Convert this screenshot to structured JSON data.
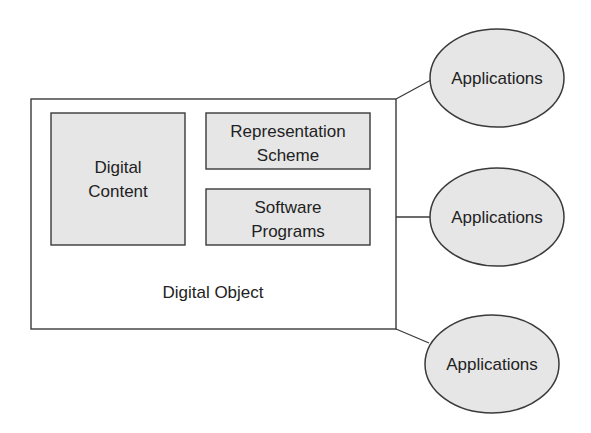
{
  "diagram": {
    "container": {
      "label": "Digital Object"
    },
    "components": [
      {
        "id": "digital-content",
        "lines": [
          "Digital",
          "Content"
        ]
      },
      {
        "id": "representation-scheme",
        "lines": [
          "Representation",
          "Scheme"
        ]
      },
      {
        "id": "software-programs",
        "lines": [
          "Software",
          "Programs"
        ]
      }
    ],
    "applications": [
      {
        "label": "Applications"
      },
      {
        "label": "Applications"
      },
      {
        "label": "Applications"
      }
    ],
    "colors": {
      "box_fill": "#e6e6e6",
      "stroke": "#3a3a3a",
      "text": "#222222",
      "background": "#ffffff"
    }
  }
}
